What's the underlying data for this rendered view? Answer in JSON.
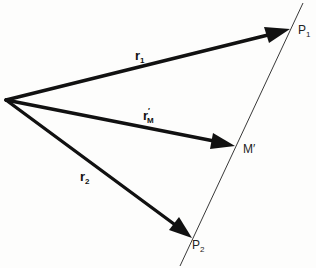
{
  "diagram": {
    "type": "vector-diagram",
    "origin": {
      "x": 5,
      "y": 100
    },
    "line": {
      "name": "line through P1, M', P2",
      "from": {
        "x": 303,
        "y": 3
      },
      "to": {
        "x": 180,
        "y": 266
      }
    },
    "vectors": [
      {
        "id": "r1",
        "base": "r",
        "subscript": "1",
        "prime": "",
        "to": {
          "x": 290,
          "y": 29
        },
        "label_pos": {
          "x": 135,
          "y": 60
        }
      },
      {
        "id": "rM",
        "base": "r",
        "subscript": "M",
        "prime": "′",
        "to": {
          "x": 235,
          "y": 146
        },
        "label_pos": {
          "x": 143,
          "y": 120
        }
      },
      {
        "id": "r2",
        "base": "r",
        "subscript": "2",
        "prime": "",
        "to": {
          "x": 192,
          "y": 238
        },
        "label_pos": {
          "x": 80,
          "y": 181
        }
      }
    ],
    "points": [
      {
        "id": "P1",
        "base": "P",
        "subscript": "1",
        "label_pos": {
          "x": 298,
          "y": 34
        }
      },
      {
        "id": "M",
        "base": "M′",
        "subscript": "",
        "label_pos": {
          "x": 243,
          "y": 153
        }
      },
      {
        "id": "P2",
        "base": "P",
        "subscript": "2",
        "label_pos": {
          "x": 192,
          "y": 249
        }
      }
    ]
  },
  "labels": {
    "r1": {
      "base": "r",
      "sub": "1"
    },
    "rM": {
      "base": "r",
      "prime": "′",
      "sub": "M"
    },
    "r2": {
      "base": "r",
      "sub": "2"
    },
    "P1": {
      "base": "P",
      "sub": "1"
    },
    "M": {
      "base": "M′"
    },
    "P2": {
      "base": "P",
      "sub": "2"
    }
  },
  "colors": {
    "ink": "#111111",
    "paper": "#fdfdfc"
  }
}
